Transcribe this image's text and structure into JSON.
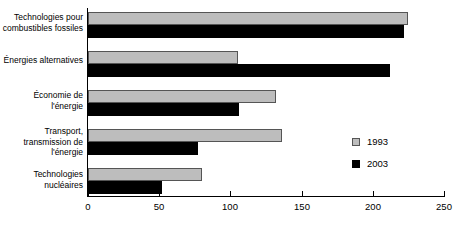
{
  "chart_data": {
    "type": "bar",
    "orientation": "horizontal",
    "title": "",
    "xlabel": "",
    "ylabel": "",
    "xlim": [
      0,
      250
    ],
    "grid": false,
    "legend_position": "right-inside",
    "xticks": [
      {
        "value": 0,
        "label": "0"
      },
      {
        "value": 50,
        "label": "50"
      },
      {
        "value": 100,
        "label": "100"
      },
      {
        "value": 150,
        "label": "150"
      },
      {
        "value": 200,
        "label": "200"
      },
      {
        "value": 250,
        "label": "250"
      }
    ],
    "categories": [
      "Technologies pour\ncombustibles fossiles",
      "Énergies alternatives",
      "Économie de\nl'énergie",
      "Transport,\ntransmission de\nl'énergie",
      "Technologies\nnucléaires"
    ],
    "series": [
      {
        "name": "1993",
        "color": "#bdbdbd",
        "values": [
          225,
          105,
          132,
          136,
          80
        ]
      },
      {
        "name": "2003",
        "color": "#000000",
        "values": [
          222,
          212,
          106,
          77,
          52
        ]
      }
    ]
  },
  "legend": {
    "entries": [
      {
        "label": "1993",
        "swatch": "legend-swatch-1993-icon"
      },
      {
        "label": "2003",
        "swatch": "legend-swatch-2003-icon"
      }
    ]
  }
}
